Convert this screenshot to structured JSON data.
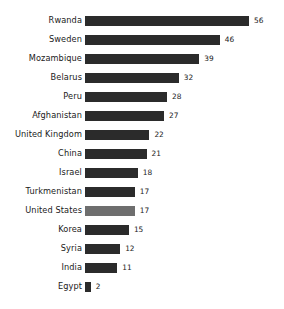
{
  "chart_data": {
    "type": "bar",
    "orientation": "horizontal",
    "title": "",
    "subtitle": "",
    "xlabel": "",
    "ylabel": "",
    "grid": false,
    "legend": false,
    "axis_visible": false,
    "xlim": [
      0,
      56
    ],
    "categories": [
      "Rwanda",
      "Sweden",
      "Mozambique",
      "Belarus",
      "Peru",
      "Afghanistan",
      "United Kingdom",
      "China",
      "Israel",
      "Turkmenistan",
      "United States",
      "Korea",
      "Syria",
      "India",
      "Egypt"
    ],
    "values": [
      56,
      46,
      39,
      32,
      28,
      27,
      22,
      21,
      18,
      17,
      17,
      15,
      12,
      11,
      2
    ],
    "value_labels": [
      "56",
      "46",
      "39",
      "32",
      "28",
      "27",
      "22",
      "21",
      "18",
      "17",
      "17",
      "15",
      "12",
      "11",
      "2"
    ],
    "highlighted_category": "United States",
    "colors": {
      "bar": "#2b2b2b",
      "bar_highlight": "#6e6e6e",
      "background": "#ffffff",
      "text": "#1a1a1a"
    }
  }
}
